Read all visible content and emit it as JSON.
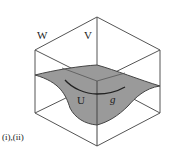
{
  "diagram": {
    "labels": {
      "w": "W",
      "v": "V",
      "u": "U",
      "g": "g",
      "caption": "(i),(ii)"
    },
    "colors": {
      "edge": "#555555",
      "surface_fill": "#9a9a9a",
      "surface_edge": "#444444",
      "curve": "#222222",
      "background": "#ffffff"
    },
    "shapes": {
      "cube": "isometric wireframe cube",
      "surface": "curved shaded surface through cube",
      "curve": "arc on surface"
    }
  }
}
